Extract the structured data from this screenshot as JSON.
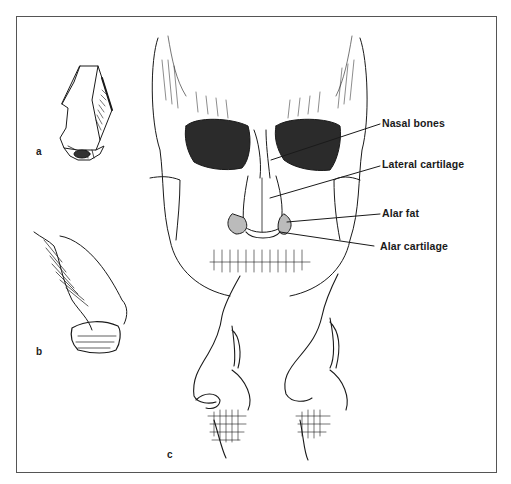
{
  "figure": {
    "subfigures": [
      {
        "id": "a",
        "label": "a",
        "description": "Geometric block model of the nose"
      },
      {
        "id": "b",
        "label": "b",
        "description": "Shaded side view of the nose"
      },
      {
        "id": "c",
        "label": "c",
        "description": "Two profile views of the face over the skull"
      }
    ],
    "callouts": [
      {
        "label": "Nasal bones"
      },
      {
        "label": "Lateral cartilage"
      },
      {
        "label": "Alar fat"
      },
      {
        "label": "Alar cartilage"
      }
    ],
    "colors": {
      "ink": "#1a1a1a",
      "paper": "#ffffff",
      "frame": "#555555"
    }
  }
}
